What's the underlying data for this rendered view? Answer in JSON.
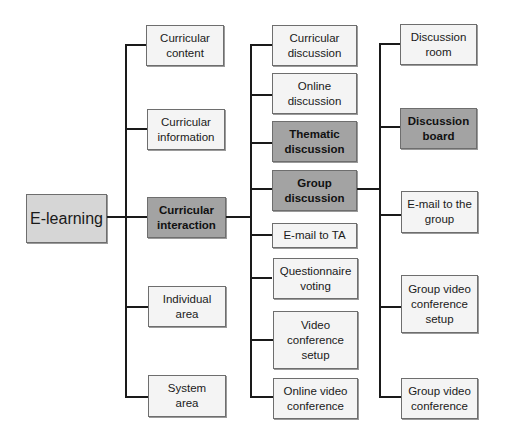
{
  "diagram": {
    "type": "hierarchy-tree",
    "colors": {
      "root_fill": "#d6d6d6",
      "highlight_fill": "#a3a3a3",
      "normal_fill": "#f4f4f4",
      "line": "#1a1a1a"
    },
    "root": {
      "label": "E-learning"
    },
    "level1": [
      {
        "label": "Curricular\ncontent"
      },
      {
        "label": "Curricular\ninformation"
      },
      {
        "label": "Curricular\ninteraction",
        "highlight": true
      },
      {
        "label": "Individual\narea"
      },
      {
        "label": "System\narea"
      }
    ],
    "level2": [
      {
        "label": "Curricular\ndiscussion"
      },
      {
        "label": "Online\ndiscussion"
      },
      {
        "label": "Thematic\ndiscussion",
        "highlight": true
      },
      {
        "label": "Group\ndiscussion",
        "highlight": true
      },
      {
        "label": "E-mail to TA"
      },
      {
        "label": "Questionnaire\nvoting"
      },
      {
        "label": "Video\nconference\nsetup"
      },
      {
        "label": "Online video\nconference"
      }
    ],
    "level3": [
      {
        "label": "Discussion\nroom"
      },
      {
        "label": "Discussion\nboard",
        "highlight": true
      },
      {
        "label": "E-mail to the\ngroup"
      },
      {
        "label": "Group video\nconference\nsetup"
      },
      {
        "label": "Group video\nconference"
      }
    ]
  }
}
